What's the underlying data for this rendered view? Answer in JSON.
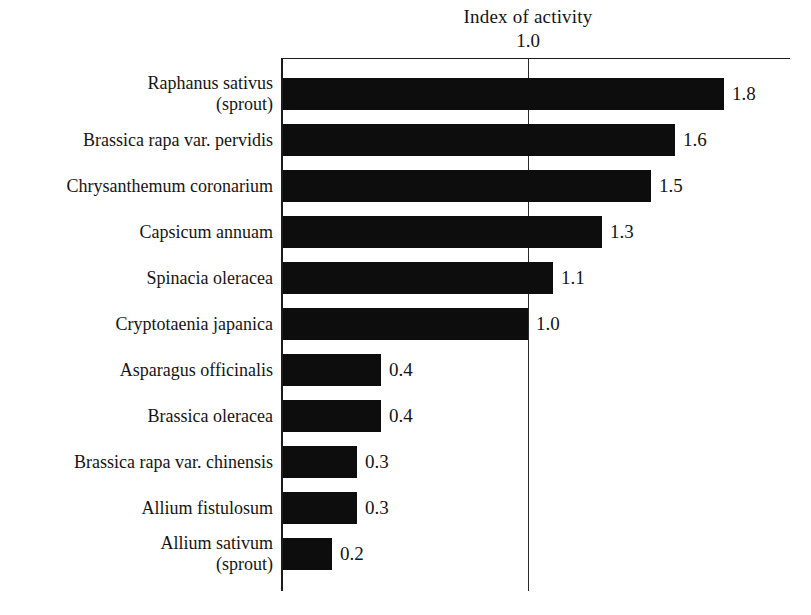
{
  "chart_data": {
    "type": "bar",
    "orientation": "horizontal",
    "title": "Index of activity",
    "xlabel": "",
    "ylabel": "",
    "xlim": [
      0,
      1.95
    ],
    "grid": false,
    "gridlines": [
      1.0
    ],
    "tick_labels": [
      "1.0"
    ],
    "legend": null,
    "categories": [
      "Raphanus sativus (sprout)",
      "Brassica rapa var. pervidis",
      "Chrysanthemum coronarium",
      "Capsicum annuam",
      "Spinacia oleracea",
      "Cryptotaenia japanica",
      "Asparagus officinalis",
      "Brassica oleracea",
      "Brassica rapa var. chinensis",
      "Allium fistulosum",
      "Allium sativum (sprout)"
    ],
    "values": [
      1.8,
      1.6,
      1.5,
      1.3,
      1.1,
      1.0,
      0.4,
      0.4,
      0.3,
      0.3,
      0.2
    ],
    "value_labels": [
      "1.8",
      "1.6",
      "1.5",
      "1.3",
      "1.1",
      "1.0",
      "0.4",
      "0.4",
      "0.3",
      "0.3",
      "0.2"
    ],
    "bar_color": "#0d0d0d",
    "background_color": "#ffffff"
  },
  "rows": [
    {
      "label_line1": "Raphanus sativus",
      "label_line2": "(sprout)",
      "value": 1.8,
      "value_label": "1.8"
    },
    {
      "label_line1": "Brassica rapa var. pervidis",
      "label_line2": "",
      "value": 1.6,
      "value_label": "1.6"
    },
    {
      "label_line1": "Chrysanthemum coronarium",
      "label_line2": "",
      "value": 1.5,
      "value_label": "1.5"
    },
    {
      "label_line1": "Capsicum annuam",
      "label_line2": "",
      "value": 1.3,
      "value_label": "1.3"
    },
    {
      "label_line1": "Spinacia oleracea",
      "label_line2": "",
      "value": 1.1,
      "value_label": "1.1"
    },
    {
      "label_line1": "Cryptotaenia japanica",
      "label_line2": "",
      "value": 1.0,
      "value_label": "1.0"
    },
    {
      "label_line1": "Asparagus officinalis",
      "label_line2": "",
      "value": 0.4,
      "value_label": "0.4"
    },
    {
      "label_line1": "Brassica oleracea",
      "label_line2": "",
      "value": 0.4,
      "value_label": "0.4"
    },
    {
      "label_line1": "Brassica rapa var. chinensis",
      "label_line2": "",
      "value": 0.3,
      "value_label": "0.3"
    },
    {
      "label_line1": "Allium fistulosum",
      "label_line2": "",
      "value": 0.3,
      "value_label": "0.3"
    },
    {
      "label_line1": "Allium sativum",
      "label_line2": "(sprout)",
      "value": 0.2,
      "value_label": "0.2"
    }
  ],
  "axis": {
    "tick_label": "1.0",
    "title": "Index of activity"
  },
  "geometry": {
    "plot_left_px": 283,
    "row_top_px": 71,
    "row_pitch_px": 46,
    "bar_height_px": 32,
    "px_per_unit": 245
  }
}
